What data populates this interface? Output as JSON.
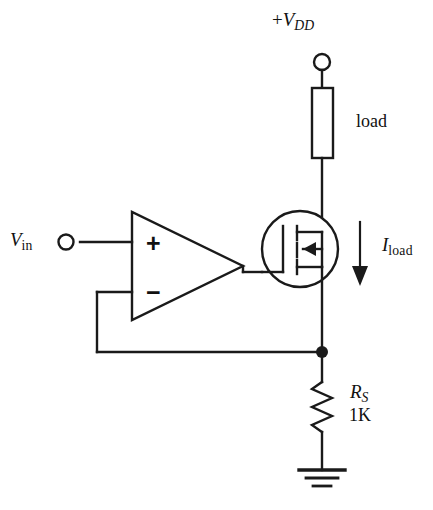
{
  "figure": {
    "background_color": "#ffffff",
    "line_color": "#1a1a1a",
    "width": 433,
    "height": 510
  },
  "labels": {
    "supply": {
      "sign": "+",
      "symbol": "V",
      "subscript": "DD",
      "full": "+VDD"
    },
    "load": "load",
    "load_current": {
      "symbol": "I",
      "subscript": "load",
      "full": "Iload"
    },
    "input": {
      "symbol": "V",
      "subscript": "in",
      "full": "Vin"
    },
    "sense_resistor": {
      "symbol": "R",
      "subscript": "S",
      "full": "RS"
    },
    "sense_value": "1K"
  },
  "opamp": {
    "noninverting_sign": "+",
    "inverting_sign": "−"
  },
  "components": [
    {
      "name": "supply-terminal",
      "type": "terminal",
      "label": "+VDD"
    },
    {
      "name": "load-resistor",
      "type": "box-resistor",
      "label": "load"
    },
    {
      "name": "mosfet",
      "type": "n-channel-enhancement-mosfet",
      "label": ""
    },
    {
      "name": "opamp",
      "type": "operational-amplifier",
      "label": ""
    },
    {
      "name": "input-terminal",
      "type": "terminal",
      "label": "Vin"
    },
    {
      "name": "sense-resistor",
      "type": "zigzag-resistor",
      "label": "RS 1K"
    },
    {
      "name": "ground",
      "type": "ground-symbol",
      "label": ""
    },
    {
      "name": "current-arrow",
      "type": "arrow",
      "label": "Iload"
    },
    {
      "name": "junction-node",
      "type": "node-dot",
      "label": ""
    }
  ]
}
